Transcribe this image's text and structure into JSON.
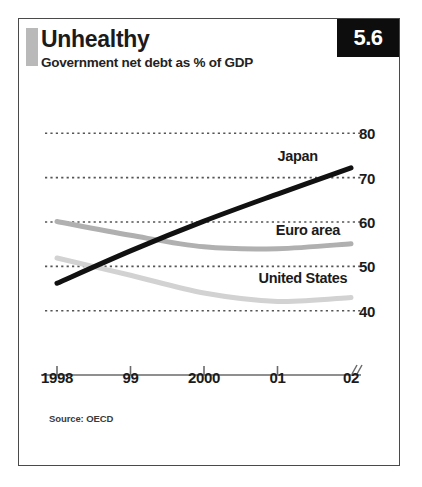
{
  "panel": {
    "title": "Unhealthy",
    "subtitle": "Government net debt as % of GDP",
    "badge": "5.6",
    "source": "Source: OECD"
  },
  "colors": {
    "background": "#ffffff",
    "border": "#4a4a4a",
    "badge_bg": "#0d0d0d",
    "badge_text": "#ffffff",
    "accent_bar": "#b9b9b9",
    "japan_line": "#111111",
    "euro_area_line": "#b0b0b0",
    "united_states_line": "#d2d2d2",
    "gridline": "#555555",
    "axis": "#6a6a6a",
    "text": "#1b1b1b"
  },
  "chart_data": {
    "type": "line",
    "title": "Unhealthy",
    "subtitle": "Government net debt as % of GDP",
    "xlabel": "",
    "ylabel": "",
    "ylim": [
      35,
      85
    ],
    "yticks": [
      40,
      50,
      60,
      70,
      80
    ],
    "ytick_labels": [
      "40",
      "50",
      "60",
      "70",
      "80"
    ],
    "categories": [
      1998,
      1999,
      2000,
      2001,
      2002
    ],
    "xtick_labels": [
      "1998",
      "99",
      "2000",
      "01",
      "02"
    ],
    "grid": "horizontal-dotted",
    "legend": "inline-labels",
    "axis_break": true,
    "series": [
      {
        "name": "Japan",
        "color": "#111111",
        "width": 5,
        "label_x": 2001.55,
        "label_y": 74.6,
        "values": [
          46.2,
          53.5,
          60.2,
          66.3,
          72.2
        ]
      },
      {
        "name": "Euro area",
        "color": "#b0b0b0",
        "width": 5,
        "label_x": 2001.85,
        "label_y": 58.0,
        "values": [
          60.1,
          57.0,
          54.4,
          54.0,
          55.1
        ]
      },
      {
        "name": "United States",
        "color": "#d2d2d2",
        "width": 5,
        "label_x": 2001.95,
        "label_y": 47.2,
        "values": [
          51.9,
          48.0,
          44.0,
          42.1,
          43.0
        ]
      }
    ]
  }
}
